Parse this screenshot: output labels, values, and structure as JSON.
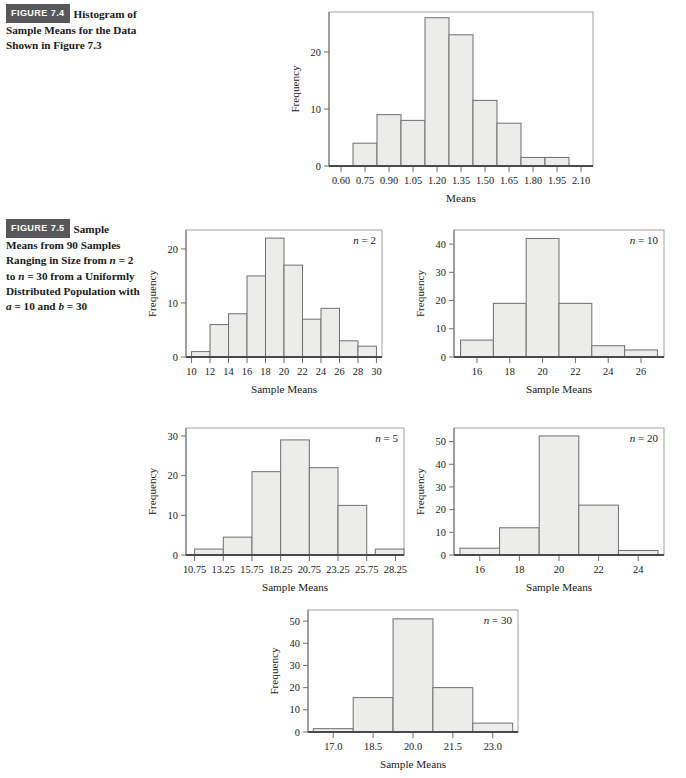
{
  "figures": [
    {
      "id": "fig-7-4",
      "badge": "FIGURE 7.4",
      "caption": "Histogram of Sample Means for the Data Shown in Figure 7.3"
    },
    {
      "id": "fig-7-5",
      "badge": "FIGURE 7.5",
      "caption_parts": [
        {
          "t": "Sample Means from 90 Samples Ranging in Size from ",
          "i": false
        },
        {
          "t": "n",
          "i": true
        },
        {
          "t": " = 2 to ",
          "i": false
        },
        {
          "t": "n",
          "i": true
        },
        {
          "t": " = 30 from a Uniformly Distributed Population with ",
          "i": false
        },
        {
          "t": "a",
          "i": true
        },
        {
          "t": " = 10 and ",
          "i": false
        },
        {
          "t": "b",
          "i": true
        },
        {
          "t": " = 30",
          "i": false
        }
      ]
    }
  ],
  "chart_data": [
    {
      "id": "hist-means",
      "type": "bar",
      "title": "",
      "annotation": "",
      "xlabel": "Means",
      "ylabel": "Frequency",
      "xticks": [
        "0.60",
        "0.75",
        "0.90",
        "1.05",
        "1.20",
        "1.35",
        "1.50",
        "1.65",
        "1.80",
        "1.95",
        "2.10"
      ],
      "xtick_values": [
        0.6,
        0.75,
        0.9,
        1.05,
        1.2,
        1.35,
        1.5,
        1.65,
        1.8,
        1.95,
        2.1
      ],
      "yticks": [
        0,
        10,
        20
      ],
      "ylim": [
        0,
        27
      ],
      "xlim": [
        0.525,
        2.175
      ],
      "bin_width": 0.15,
      "bin_starts": [
        0.675,
        0.825,
        0.975,
        1.125,
        1.275,
        1.425,
        1.575,
        1.725,
        1.875
      ],
      "values": [
        4,
        9,
        8,
        26,
        23,
        11.5,
        7.5,
        1.5,
        1.5
      ],
      "grid": false,
      "legend": "none"
    },
    {
      "id": "hist-n2",
      "type": "bar",
      "title": "",
      "annotation": "n = 2",
      "annotation_n": "2",
      "xlabel": "Sample Means",
      "ylabel": "Frequency",
      "xticks": [
        "10",
        "12",
        "14",
        "16",
        "18",
        "20",
        "22",
        "24",
        "26",
        "28",
        "30"
      ],
      "xtick_values": [
        10,
        12,
        14,
        16,
        18,
        20,
        22,
        24,
        26,
        28,
        30
      ],
      "yticks": [
        0,
        10,
        20
      ],
      "ylim": [
        0,
        23.5
      ],
      "xlim": [
        9.4,
        30.6
      ],
      "bin_width": 2,
      "bin_starts": [
        10,
        12,
        14,
        16,
        18,
        20,
        22,
        24,
        26,
        28
      ],
      "values": [
        1,
        6,
        8,
        15,
        22,
        17,
        7,
        9,
        3,
        2
      ],
      "grid": false,
      "legend": "none"
    },
    {
      "id": "hist-n10",
      "type": "bar",
      "title": "",
      "annotation": "n = 10",
      "annotation_n": "10",
      "xlabel": "Sample Means",
      "ylabel": "Frequency",
      "xticks": [
        "16",
        "18",
        "20",
        "22",
        "24",
        "26"
      ],
      "xtick_values": [
        16,
        18,
        20,
        22,
        24,
        26
      ],
      "yticks": [
        0,
        10,
        20,
        30,
        40
      ],
      "ylim": [
        0,
        45
      ],
      "xlim": [
        14.6,
        27.4
      ],
      "bin_width": 2,
      "bin_starts": [
        15,
        17,
        19,
        21,
        23,
        25
      ],
      "values": [
        6,
        19,
        42,
        19,
        4,
        2.5
      ],
      "grid": false,
      "legend": "none"
    },
    {
      "id": "hist-n5",
      "type": "bar",
      "title": "",
      "annotation": "n = 5",
      "annotation_n": "5",
      "xlabel": "Sample Means",
      "ylabel": "Frequency",
      "xticks": [
        "10.75",
        "13.25",
        "15.75",
        "18.25",
        "20.75",
        "23.25",
        "25.75",
        "28.25"
      ],
      "xtick_values": [
        10.75,
        13.25,
        15.75,
        18.25,
        20.75,
        23.25,
        25.75,
        28.25
      ],
      "yticks": [
        0,
        10,
        20,
        30
      ],
      "ylim": [
        0,
        32
      ],
      "xlim": [
        10.0,
        29.0
      ],
      "bin_width": 2.5,
      "bin_starts": [
        10.75,
        13.25,
        15.75,
        18.25,
        20.75,
        23.25,
        26.5
      ],
      "values": [
        1.5,
        4.5,
        21,
        29,
        22,
        12.5,
        1.5
      ],
      "grid": false,
      "legend": "none"
    },
    {
      "id": "hist-n20",
      "type": "bar",
      "title": "",
      "annotation": "n = 20",
      "annotation_n": "20",
      "xlabel": "Sample Means",
      "ylabel": "Frequency",
      "xticks": [
        "16",
        "18",
        "20",
        "22",
        "24"
      ],
      "xtick_values": [
        16,
        18,
        20,
        22,
        24
      ],
      "yticks": [
        0,
        10,
        20,
        30,
        40,
        50
      ],
      "ylim": [
        0,
        56
      ],
      "xlim": [
        14.7,
        25.3
      ],
      "bin_width": 2,
      "bin_starts": [
        15,
        17,
        19,
        21,
        23
      ],
      "values": [
        3,
        12,
        52.5,
        22,
        2
      ],
      "grid": false,
      "legend": "none"
    },
    {
      "id": "hist-n30",
      "type": "bar",
      "title": "",
      "annotation": "n = 30",
      "annotation_n": "30",
      "xlabel": "Sample Means",
      "ylabel": "Frequency",
      "xticks": [
        "17.0",
        "18.5",
        "20.0",
        "21.5",
        "23.0"
      ],
      "xtick_values": [
        17.0,
        18.5,
        20.0,
        21.5,
        23.0
      ],
      "yticks": [
        0,
        10,
        20,
        30,
        40,
        50
      ],
      "ylim": [
        0,
        55
      ],
      "xlim": [
        16.05,
        23.95
      ],
      "bin_width": 1.5,
      "bin_starts": [
        16.25,
        17.75,
        19.25,
        20.75,
        22.25
      ],
      "values": [
        1.5,
        15.5,
        51,
        20,
        4
      ],
      "grid": false,
      "legend": "none"
    }
  ],
  "layout": {
    "positions": {
      "hist-means": {
        "left": 283,
        "top": 2,
        "w": 318,
        "h": 210
      },
      "hist-n2": {
        "left": 140,
        "top": 220,
        "w": 250,
        "h": 183
      },
      "hist-n10": {
        "left": 408,
        "top": 220,
        "w": 264,
        "h": 183
      },
      "hist-n5": {
        "left": 140,
        "top": 418,
        "w": 272,
        "h": 183
      },
      "hist-n20": {
        "left": 408,
        "top": 418,
        "w": 264,
        "h": 183
      },
      "hist-n30": {
        "left": 262,
        "top": 600,
        "w": 264,
        "h": 178
      }
    }
  }
}
